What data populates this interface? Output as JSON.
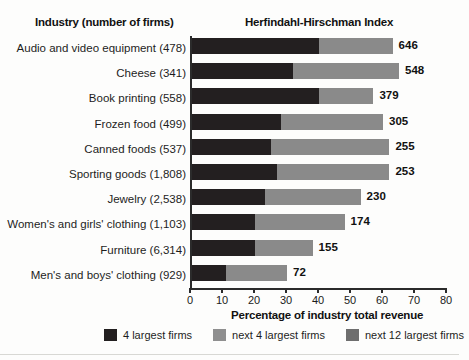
{
  "header": {
    "industry_title": "Industry (number of firms)",
    "hhi_title": "Herfindahl-Hirschman Index"
  },
  "legend": [
    {
      "label": "4 largest firms",
      "color": "#231f20",
      "key": "seg-a"
    },
    {
      "label": "next 4 largest firms",
      "color": "#8f8f8f",
      "key": "seg-b"
    },
    {
      "label": "next 12 largest firms",
      "color": "#6e6e6e",
      "key": "seg-c"
    }
  ],
  "chart_data": {
    "type": "bar",
    "orientation": "horizontal",
    "stacked": true,
    "title": "Herfindahl-Hirschman Index",
    "xlabel": "Percentage of industry total revenue",
    "ylabel": "Industry (number of firms)",
    "xlim": [
      0,
      80
    ],
    "xticks": [
      0,
      10,
      20,
      30,
      40,
      50,
      60,
      70,
      80
    ],
    "xticklabels": [
      "0",
      "10",
      "20",
      "30",
      "40",
      "50",
      "60",
      "70",
      "80"
    ],
    "grid": false,
    "legend_position": "bottom",
    "categories": [
      "Audio and video equipment (478)",
      "Cheese (341)",
      "Book printing (558)",
      "Frozen food (499)",
      "Canned foods (537)",
      "Sporting goods (1,808)",
      "Jewelry (2,538)",
      "Women's and girls' clothing (1,103)",
      "Furniture (6,314)",
      "Men's and boys' clothing (929)"
    ],
    "series": [
      {
        "name": "4 largest firms",
        "values": [
          40,
          32,
          40,
          28,
          25,
          27,
          23,
          20,
          20,
          11
        ]
      },
      {
        "name": "next 4 largest firms",
        "values": [
          23,
          33,
          17,
          32,
          37,
          35,
          30,
          28,
          18,
          19
        ]
      },
      {
        "name": "next 12 largest firms",
        "values": [
          0,
          0,
          0,
          0,
          0,
          0,
          0,
          0,
          0,
          0
        ]
      }
    ],
    "value_labels": [
      "646",
      "548",
      "379",
      "305",
      "255",
      "253",
      "230",
      "174",
      "155",
      "72"
    ],
    "value_label_name": "Herfindahl-Hirschman Index"
  }
}
